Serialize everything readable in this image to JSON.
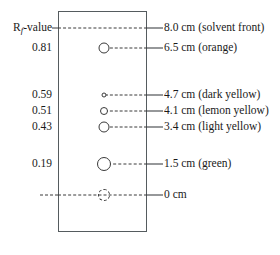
{
  "figure": {
    "left_header": {
      "prefix": "R",
      "subscript": "f",
      "suffix": "-value"
    },
    "plate": {
      "outline_color": "#555b5e",
      "fill_color": "#ffffff"
    },
    "line_color": "#3a3a3a"
  },
  "rows": [
    {
      "rf": "",
      "distance": "8.0 cm (solvent front)",
      "y": 28,
      "has_spot": false,
      "spot_size": 0,
      "spot_dashed": false,
      "dash_left": 58,
      "dash_right": 147,
      "show_left_dash": true
    },
    {
      "rf": "0.81",
      "distance": "6.5 cm (orange)",
      "y": 48,
      "has_spot": true,
      "spot_size": 11,
      "spot_dashed": false,
      "dash_left": 105,
      "dash_right": 147,
      "show_left_dash": false
    },
    {
      "rf": "0.59",
      "distance": "4.7 cm (dark yellow)",
      "y": 95,
      "has_spot": true,
      "spot_size": 5,
      "spot_dashed": false,
      "dash_left": 105,
      "dash_right": 147,
      "show_left_dash": false
    },
    {
      "rf": "0.51",
      "distance": "4.1 cm (lemon yellow)",
      "y": 111,
      "has_spot": true,
      "spot_size": 8,
      "spot_dashed": false,
      "dash_left": 105,
      "dash_right": 147,
      "show_left_dash": false
    },
    {
      "rf": "0.43",
      "distance": "3.4 cm (light yellow)",
      "y": 127,
      "has_spot": true,
      "spot_size": 11,
      "spot_dashed": false,
      "dash_left": 105,
      "dash_right": 147,
      "show_left_dash": false
    },
    {
      "rf": "0.19",
      "distance": "1.5 cm (green)",
      "y": 164,
      "has_spot": true,
      "spot_size": 14,
      "spot_dashed": false,
      "dash_left": 108,
      "dash_right": 147,
      "show_left_dash": false
    },
    {
      "rf": "",
      "distance": "0 cm",
      "y": 195,
      "has_spot": true,
      "spot_size": 12,
      "spot_dashed": true,
      "dash_left": 58,
      "dash_right": 147,
      "show_left_dash": true
    }
  ],
  "spot_center_x": 104,
  "chart_data": {
    "type": "table",
    "columns": [
      "Rf-value",
      "Distance",
      "Band"
    ],
    "rows": [
      [
        "",
        "8.0 cm",
        "solvent front"
      ],
      [
        "0.81",
        "6.5 cm",
        "orange"
      ],
      [
        "0.59",
        "4.7 cm",
        "dark yellow"
      ],
      [
        "0.51",
        "4.1 cm",
        "lemon yellow"
      ],
      [
        "0.43",
        "3.4 cm",
        "light yellow"
      ],
      [
        "0.19",
        "1.5 cm",
        "green"
      ],
      [
        "",
        "0 cm",
        "baseline"
      ]
    ],
    "solvent_front_cm": 8.0,
    "baseline_cm": 0,
    "rf_values": [
      0.81,
      0.59,
      0.51,
      0.43,
      0.19
    ],
    "distances_cm": [
      6.5,
      4.7,
      4.1,
      3.4,
      1.5
    ],
    "band_labels": [
      "orange",
      "dark yellow",
      "lemon yellow",
      "light yellow",
      "green"
    ]
  }
}
